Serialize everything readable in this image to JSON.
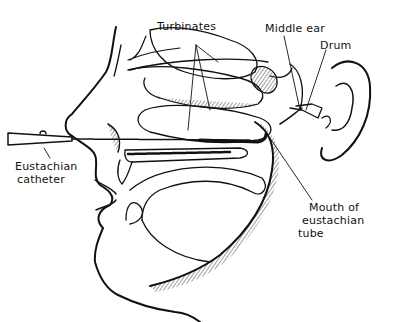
{
  "diagram": {
    "labels": {
      "turbinates": "Turbinates",
      "middle_ear": "Middle ear",
      "drum": "Drum",
      "eustachian_catheter_line1": "Eustachian",
      "eustachian_catheter_line2": "catheter",
      "mouth_line1": "Mouth of",
      "mouth_line2": "eustachian",
      "mouth_line3": "tube"
    },
    "colors": {
      "ink": "#111111",
      "background": "#ffffff"
    }
  }
}
